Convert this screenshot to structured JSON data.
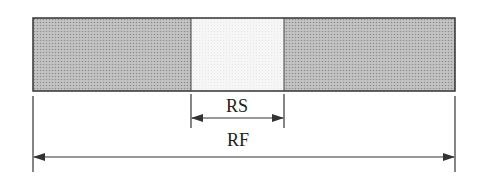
{
  "diagram": {
    "sections": [
      {
        "name": "left-shaded-section",
        "fill": "#b8b8b8"
      },
      {
        "name": "middle-light-section",
        "fill": "#f4f4f4"
      },
      {
        "name": "right-shaded-section",
        "fill": "#b8b8b8"
      }
    ],
    "dimensions": {
      "rs_label": "RS",
      "rf_label": "RF"
    },
    "colors": {
      "stroke": "#333333",
      "shaded": "#b8b8b8",
      "light": "#f4f4f4"
    }
  }
}
